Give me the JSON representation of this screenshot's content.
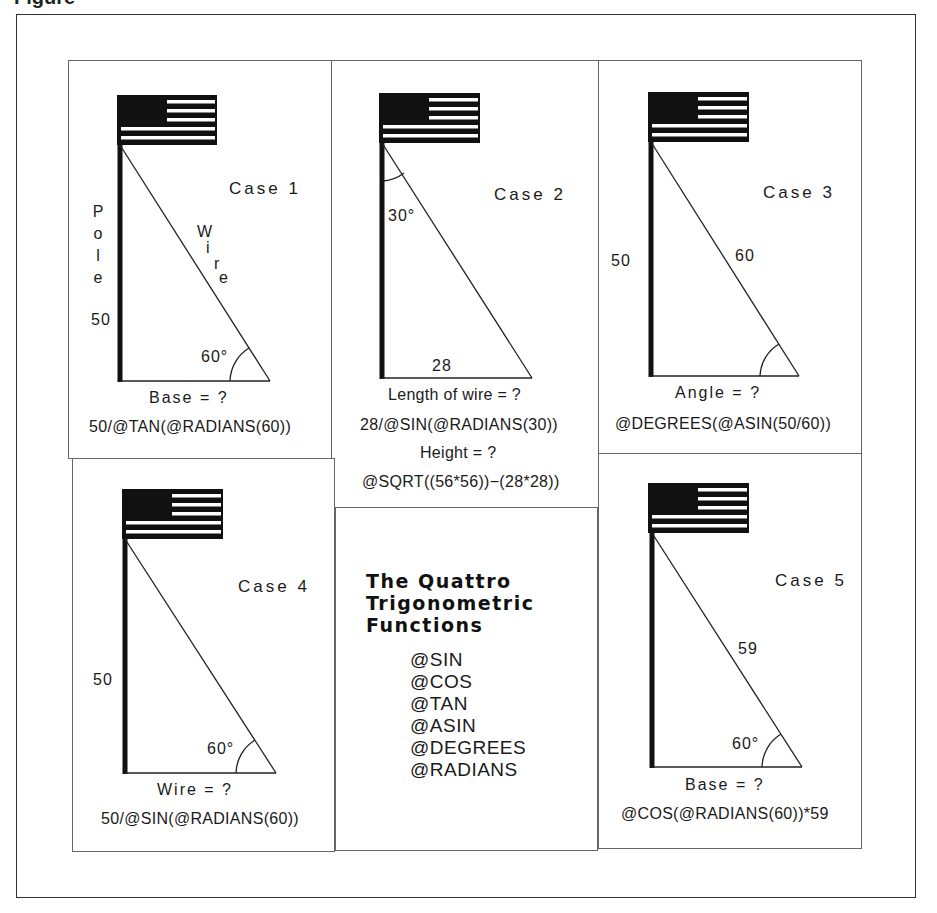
{
  "caption": "Figure",
  "cases": [
    {
      "id": "case1",
      "title": "Case 1",
      "pole_label": [
        "P",
        "o",
        "l",
        "e"
      ],
      "wire_label": [
        "W",
        "i",
        "r",
        "e"
      ],
      "side_value": "50",
      "angle": "60°",
      "question": "Base = ?",
      "formula": "50/@TAN(@RADIANS(60))"
    },
    {
      "id": "case2",
      "title": "Case 2",
      "angle": "30°",
      "base_value": "28",
      "question": "Length of wire = ?",
      "formula": "28/@SIN(@RADIANS(30))",
      "question2": "Height = ?",
      "formula2": "@SQRT((56*56))−(28*28))"
    },
    {
      "id": "case3",
      "title": "Case 3",
      "side_value": "50",
      "wire_value": "60",
      "question": "Angle = ?",
      "formula": "@DEGREES(@ASIN(50/60))"
    },
    {
      "id": "case4",
      "title": "Case 4",
      "side_value": "50",
      "angle": "60°",
      "question": "Wire = ?",
      "formula": "50/@SIN(@RADIANS(60))"
    },
    {
      "id": "case5",
      "title": "Case 5",
      "wire_value": "59",
      "angle": "60°",
      "question": "Base = ?",
      "formula": "@COS(@RADIANS(60))*59"
    }
  ],
  "functions_panel": {
    "title_lines": [
      "The Quattro",
      "Trigonometric",
      "Functions"
    ],
    "functions": [
      "@SIN",
      "@COS",
      "@TAN",
      "@ASIN",
      "@DEGREES",
      "@RADIANS"
    ]
  }
}
